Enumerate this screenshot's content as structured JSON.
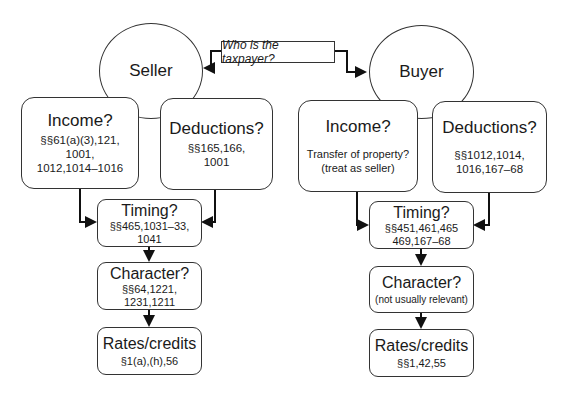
{
  "question": {
    "label": "Who is the taxpayer?"
  },
  "seller": {
    "label": "Seller",
    "income": {
      "title": "Income?",
      "refs": [
        "§§61(a)(3),121,",
        "1001,",
        "1012,1014–1016"
      ]
    },
    "deductions": {
      "title": "Deductions?",
      "refs": [
        "§§165,166,",
        "1001"
      ]
    },
    "timing": {
      "title": "Timing?",
      "refs": [
        "§§465,1031–33,",
        "1041"
      ]
    },
    "character": {
      "title": "Character?",
      "refs": [
        "§§64,1221,",
        "1231,1211"
      ]
    },
    "rates": {
      "title": "Rates/credits",
      "refs": [
        "§1(a),(h),56"
      ]
    }
  },
  "buyer": {
    "label": "Buyer",
    "income": {
      "title": "Income?",
      "refs": [
        "Transfer of property?",
        "(treat as seller)"
      ]
    },
    "deductions": {
      "title": "Deductions?",
      "refs": [
        "§§1012,1014,",
        "1016,167–68"
      ]
    },
    "timing": {
      "title": "Timing?",
      "refs": [
        "§§451,461,465",
        "469,167–68"
      ]
    },
    "character": {
      "title": "Character?",
      "refs": [
        "(not usually relevant)"
      ]
    },
    "rates": {
      "title": "Rates/credits",
      "refs": [
        "§§1,42,55"
      ]
    }
  }
}
